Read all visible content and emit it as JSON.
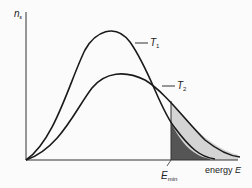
{
  "diagram": {
    "y_axis_label": "n",
    "y_axis_subscript": "ε",
    "x_axis_label": "energy",
    "x_axis_symbol": "E",
    "curves": [
      {
        "name": "T",
        "subscript": "1",
        "description": "lower temperature, taller narrower peak"
      },
      {
        "name": "T",
        "subscript": "2",
        "description": "higher temperature, lower broader peak"
      }
    ],
    "threshold_label": "E",
    "threshold_subscript": "min",
    "colors": {
      "line": "#1a1a1a",
      "shade_light": "#d4d4d4",
      "shade_dark": "#555555",
      "background": "#fbfbfb"
    }
  }
}
